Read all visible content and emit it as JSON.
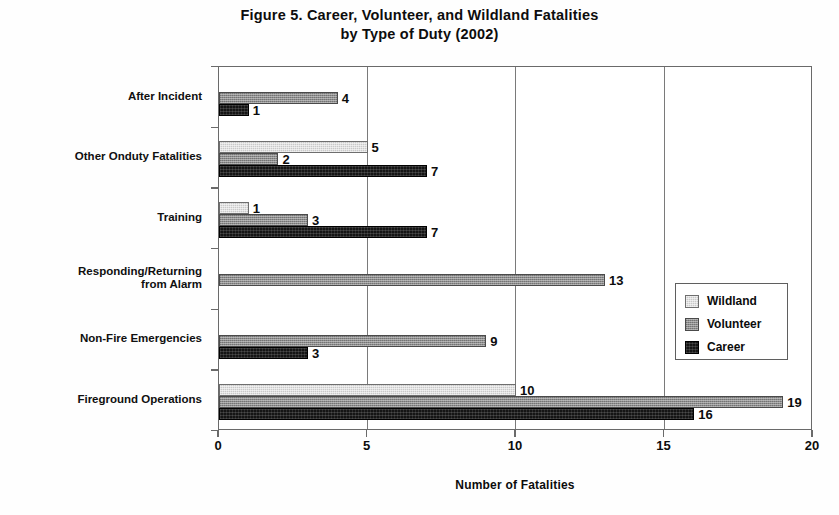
{
  "chart_data": {
    "type": "bar",
    "orientation": "horizontal",
    "title": "Figure 5. Career, Volunteer, and Wildland Fatalities by Type of Duty (2002)",
    "title_lines": [
      "Figure 5. Career, Volunteer, and Wildland Fatalities",
      "by Type of Duty (2002)"
    ],
    "xlabel": "Number of Fatalities",
    "ylabel": "",
    "xlim": [
      0,
      20
    ],
    "xticks": [
      0,
      5,
      10,
      15,
      20
    ],
    "xtick_labels": [
      "0",
      "5",
      "10",
      "15",
      "20"
    ],
    "grid": "vertical",
    "legend_position": "middle-right",
    "categories": [
      "After Incident",
      "Other Onduty Fatalities",
      "Training",
      "Responding/Returning from Alarm",
      "Non-Fire Emergencies",
      "Fireground Operations"
    ],
    "category_label_lines": [
      [
        "After Incident"
      ],
      [
        "Other Onduty Fatalities"
      ],
      [
        "Training"
      ],
      [
        "Responding/Returning",
        "from Alarm"
      ],
      [
        "Non-Fire Emergencies"
      ],
      [
        "Fireground Operations"
      ]
    ],
    "series": [
      {
        "name": "Wildland",
        "color": "#c9c9c9",
        "values": [
          null,
          5,
          1,
          null,
          null,
          10
        ],
        "labels": [
          "",
          "5",
          "1",
          "",
          "",
          "10"
        ]
      },
      {
        "name": "Volunteer",
        "color": "#8d8d8d",
        "values": [
          4,
          2,
          3,
          13,
          9,
          19
        ],
        "labels": [
          "4",
          "2",
          "3",
          "13",
          "9",
          "19"
        ]
      },
      {
        "name": "Career",
        "color": "#151515",
        "values": [
          1,
          7,
          7,
          null,
          3,
          16
        ],
        "labels": [
          "1",
          "7",
          "7",
          "",
          "3",
          "16"
        ]
      }
    ],
    "legend_entries": [
      {
        "label": "Wildland",
        "color": "#c9c9c9"
      },
      {
        "label": "Volunteer",
        "color": "#8d8d8d"
      },
      {
        "label": "Career",
        "color": "#151515"
      }
    ]
  }
}
